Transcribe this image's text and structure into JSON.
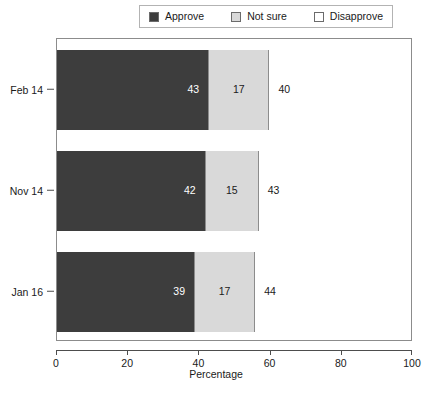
{
  "legend": {
    "items": [
      {
        "label": "Approve",
        "icon": "square-swatch-icon",
        "color": "#3d3d3d"
      },
      {
        "label": "Not sure",
        "icon": "square-swatch-icon",
        "color": "#d9d9d9"
      },
      {
        "label": "Disapprove",
        "icon": "square-swatch-icon",
        "color": "#ffffff"
      }
    ]
  },
  "axes": {
    "x_label": "Percentage",
    "x_ticks": [
      "0",
      "20",
      "40",
      "60",
      "80",
      "100"
    ],
    "y_ticks": [
      "Feb 14",
      "Nov 14",
      "Jan 16"
    ]
  },
  "caption": "",
  "chart_data": {
    "type": "bar",
    "orientation": "horizontal",
    "stacked": true,
    "title": "",
    "xlabel": "Percentage",
    "ylabel": "",
    "xlim": [
      0,
      100
    ],
    "grid": false,
    "legend_position": "top",
    "categories": [
      "Feb 14",
      "Nov 14",
      "Jan 16"
    ],
    "series": [
      {
        "name": "Approve",
        "color": "#3d3d3d",
        "values": [
          43,
          42,
          39
        ]
      },
      {
        "name": "Not sure",
        "color": "#d9d9d9",
        "values": [
          17,
          15,
          17
        ]
      },
      {
        "name": "Disapprove",
        "color": "#ffffff",
        "values": [
          40,
          43,
          44
        ]
      }
    ],
    "bars": [
      {
        "category": "Feb 14",
        "segments": [
          {
            "name": "Approve",
            "value": 43,
            "label": "43",
            "color": "#3d3d3d",
            "text_color": "#ffffff"
          },
          {
            "name": "Not sure",
            "value": 17,
            "label": "17",
            "color": "#d9d9d9",
            "text_color": "#1a1a1a"
          },
          {
            "name": "Disapprove",
            "value": 40,
            "label": "40",
            "color": "#ffffff",
            "text_color": "#1a1a1a"
          }
        ]
      },
      {
        "category": "Nov 14",
        "segments": [
          {
            "name": "Approve",
            "value": 42,
            "label": "42",
            "color": "#3d3d3d",
            "text_color": "#ffffff"
          },
          {
            "name": "Not sure",
            "value": 15,
            "label": "15",
            "color": "#d9d9d9",
            "text_color": "#1a1a1a"
          },
          {
            "name": "Disapprove",
            "value": 43,
            "label": "43",
            "color": "#ffffff",
            "text_color": "#1a1a1a"
          }
        ]
      },
      {
        "category": "Jan 16",
        "segments": [
          {
            "name": "Approve",
            "value": 39,
            "label": "39",
            "color": "#3d3d3d",
            "text_color": "#ffffff"
          },
          {
            "name": "Not sure",
            "value": 17,
            "label": "17",
            "color": "#d9d9d9",
            "text_color": "#1a1a1a"
          },
          {
            "name": "Disapprove",
            "value": 44,
            "label": "44",
            "color": "#ffffff",
            "text_color": "#1a1a1a"
          }
        ]
      }
    ]
  }
}
